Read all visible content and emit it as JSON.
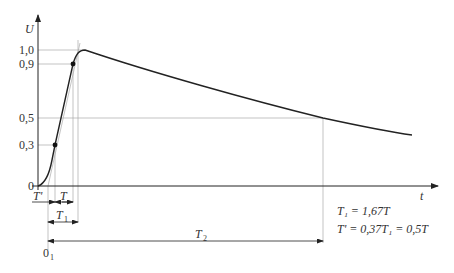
{
  "diagram": {
    "type": "impulse-voltage-waveform",
    "y_axis": {
      "label": "U",
      "ticks": [
        "1,0",
        "0,9",
        "0,5",
        "0,3",
        "0"
      ]
    },
    "x_axis": {
      "label": "t"
    },
    "origin_virtual": {
      "label": "0",
      "subscript": "1"
    },
    "intervals": [
      {
        "label": "T'",
        "sub": ""
      },
      {
        "label": "T",
        "sub": ""
      },
      {
        "label": "T",
        "sub": "1"
      },
      {
        "label": "T",
        "sub": "2"
      }
    ],
    "formulas": {
      "line1": "T₁ = 1,67T",
      "line2": "T' = 0,37T₁ = 0,5T"
    },
    "colors": {
      "curve": "#222222",
      "axis": "#222222",
      "grid": "#aaaaaa"
    }
  }
}
